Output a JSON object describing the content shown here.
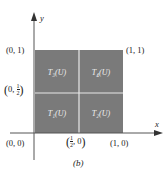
{
  "figure": {
    "caption": "(b)",
    "axis_x_label": "x",
    "axis_y_label": "y",
    "square_color": "#7a7a7a",
    "divider_color": "#e8e8e8",
    "cells": [
      {
        "id": "T1",
        "label": "T₁(U)",
        "position": "bottom-left"
      },
      {
        "id": "T2",
        "label": "T₂(U)",
        "position": "bottom-right"
      },
      {
        "id": "T3",
        "label": "T₃(U)",
        "position": "top-left"
      },
      {
        "id": "T4",
        "label": "T₄(U)",
        "position": "top-right"
      }
    ],
    "points": {
      "origin": "(0, 0)",
      "top_left": "(0, 1)",
      "top_right": "(1, 1)",
      "bottom_right": "(1, 0)",
      "mid_left_prefix": "0,",
      "mid_bottom_suffix": ", 0",
      "half_num": "1",
      "half_den": "2"
    }
  }
}
